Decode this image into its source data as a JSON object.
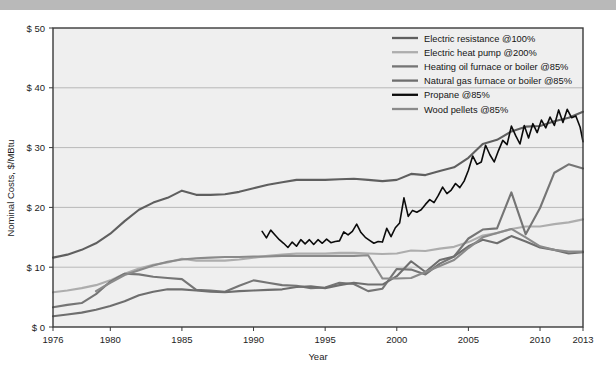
{
  "figure": {
    "background_color": "#efefef",
    "border_color": "#3a3a3a",
    "top_band_color": "#b9b9b9",
    "grid_color": "#a9a9a9"
  },
  "chart_data": {
    "type": "line",
    "title": "",
    "xlabel": "Year",
    "ylabel": "Nominal Costs, $/MBtu",
    "xlim": [
      1976,
      2013
    ],
    "ylim": [
      0,
      50
    ],
    "grid": true,
    "grid_axis": "y",
    "legend_position": "top-right",
    "x_ticks": [
      1976,
      1980,
      1985,
      1990,
      1995,
      2000,
      2005,
      2010,
      2013
    ],
    "x_tick_labels": [
      "1976",
      "1980",
      "1985",
      "1990",
      "1995",
      "2000",
      "2005",
      "2010",
      "2013"
    ],
    "y_ticks": [
      0,
      10,
      20,
      30,
      40,
      50
    ],
    "y_tick_labels": [
      "$ 0",
      "$ 10",
      "$ 20",
      "$ 30",
      "$ 40",
      "$ 50"
    ],
    "series": [
      {
        "name": "Electric resistance @100%",
        "color": "#5f5f5f",
        "width": 2.1,
        "x": [
          1976,
          1977,
          1978,
          1979,
          1980,
          1981,
          1982,
          1983,
          1984,
          1985,
          1986,
          1987,
          1988,
          1989,
          1990,
          1991,
          1992,
          1993,
          1994,
          1995,
          1996,
          1997,
          1998,
          1999,
          2000,
          2001,
          2002,
          2003,
          2004,
          2005,
          2006,
          2007,
          2008,
          2009,
          2010,
          2011,
          2012,
          2013
        ],
        "values": [
          11.6,
          12.1,
          12.9,
          14.0,
          15.6,
          17.7,
          19.6,
          20.8,
          21.6,
          22.8,
          22.1,
          22.1,
          22.2,
          22.6,
          23.2,
          23.8,
          24.2,
          24.6,
          24.6,
          24.6,
          24.7,
          24.8,
          24.6,
          24.4,
          24.6,
          25.6,
          25.4,
          26.1,
          26.7,
          28.3,
          30.6,
          31.3,
          32.7,
          33.5,
          33.6,
          34.4,
          35.0,
          36.0
        ]
      },
      {
        "name": "Electric heat pump @200%",
        "color": "#adadad",
        "width": 2.1,
        "x": [
          1976,
          1977,
          1978,
          1979,
          1980,
          1981,
          1982,
          1983,
          1984,
          1985,
          1986,
          1987,
          1988,
          1989,
          1990,
          1991,
          1992,
          1993,
          1994,
          1995,
          1996,
          1997,
          1998,
          1999,
          2000,
          2001,
          2002,
          2003,
          2004,
          2005,
          2006,
          2007,
          2008,
          2009,
          2010,
          2011,
          2012,
          2013
        ],
        "values": [
          5.8,
          6.1,
          6.5,
          7.0,
          7.8,
          8.9,
          9.8,
          10.4,
          10.8,
          11.4,
          11.1,
          11.1,
          11.1,
          11.3,
          11.6,
          11.9,
          12.1,
          12.3,
          12.3,
          12.3,
          12.4,
          12.4,
          12.3,
          12.2,
          12.3,
          12.8,
          12.7,
          13.1,
          13.4,
          14.2,
          15.3,
          15.7,
          16.4,
          16.8,
          16.8,
          17.2,
          17.5,
          18.0
        ]
      },
      {
        "name": "Heating oil furnace or boiler @85%",
        "color": "#757575",
        "width": 2.1,
        "x": [
          1976,
          1977,
          1978,
          1979,
          1980,
          1981,
          1982,
          1983,
          1984,
          1985,
          1986,
          1987,
          1988,
          1989,
          1990,
          1991,
          1992,
          1993,
          1994,
          1995,
          1996,
          1997,
          1998,
          1999,
          2000,
          2001,
          2002,
          2003,
          2004,
          2005,
          2006,
          2007,
          2008,
          2009,
          2010,
          2011,
          2012,
          2013
        ],
        "values": [
          3.3,
          3.7,
          4.0,
          5.5,
          7.6,
          8.9,
          8.8,
          8.4,
          8.2,
          8.0,
          6.2,
          6.1,
          5.9,
          6.9,
          7.8,
          7.4,
          7.0,
          6.9,
          6.5,
          6.6,
          7.4,
          7.2,
          6.0,
          6.4,
          9.7,
          9.6,
          8.8,
          10.6,
          11.8,
          14.8,
          16.3,
          16.5,
          22.5,
          15.5,
          19.9,
          25.8,
          27.2,
          26.5
        ]
      },
      {
        "name": "Natural gas furnace or boiler @85%",
        "color": "#6e6e6e",
        "width": 2.1,
        "x": [
          1976,
          1977,
          1978,
          1979,
          1980,
          1981,
          1982,
          1983,
          1984,
          1985,
          1986,
          1987,
          1988,
          1989,
          1990,
          1991,
          1992,
          1993,
          1994,
          1995,
          1996,
          1997,
          1998,
          1999,
          2000,
          2001,
          2002,
          2003,
          2004,
          2005,
          2006,
          2007,
          2008,
          2009,
          2010,
          2011,
          2012,
          2013
        ],
        "values": [
          1.8,
          2.1,
          2.4,
          2.9,
          3.5,
          4.3,
          5.3,
          5.9,
          6.3,
          6.3,
          6.1,
          5.9,
          5.8,
          6.0,
          6.1,
          6.2,
          6.3,
          6.7,
          6.8,
          6.5,
          7.0,
          7.4,
          7.1,
          7.1,
          8.5,
          11.0,
          9.2,
          11.2,
          11.8,
          13.5,
          14.6,
          14.0,
          15.2,
          14.3,
          13.3,
          12.9,
          12.3,
          12.5
        ]
      },
      {
        "name": "Propane @85%",
        "color": "#0b0b0b",
        "width": 1.6,
        "x": [
          1990.6,
          1990.9,
          1991.2,
          1991.5,
          1991.8,
          1992.1,
          1992.4,
          1992.7,
          1993.0,
          1993.3,
          1993.6,
          1993.9,
          1994.2,
          1994.5,
          1994.8,
          1995.1,
          1995.4,
          1995.7,
          1996.0,
          1996.3,
          1996.6,
          1996.9,
          1997.2,
          1997.5,
          1997.8,
          1998.1,
          1998.4,
          1998.7,
          1999.0,
          1999.3,
          1999.6,
          1999.9,
          2000.2,
          2000.5,
          2000.8,
          2001.1,
          2001.4,
          2001.7,
          2002.0,
          2002.3,
          2002.6,
          2002.9,
          2003.2,
          2003.5,
          2003.8,
          2004.1,
          2004.4,
          2004.7,
          2005.0,
          2005.3,
          2005.6,
          2005.9,
          2006.2,
          2006.5,
          2006.8,
          2007.1,
          2007.4,
          2007.7,
          2008.0,
          2008.3,
          2008.6,
          2008.9,
          2009.2,
          2009.5,
          2009.8,
          2010.1,
          2010.4,
          2010.7,
          2011.0,
          2011.3,
          2011.6,
          2011.9,
          2012.2,
          2012.5,
          2012.8,
          2013.0
        ],
        "values": [
          16.0,
          14.9,
          16.2,
          15.4,
          14.6,
          14.0,
          13.3,
          14.2,
          13.5,
          14.6,
          13.9,
          14.6,
          13.8,
          14.6,
          14.0,
          14.7,
          14.1,
          14.3,
          14.4,
          15.9,
          15.4,
          16.0,
          17.2,
          15.8,
          15.0,
          14.5,
          14.0,
          14.3,
          14.2,
          16.5,
          15.1,
          16.6,
          17.4,
          21.6,
          18.5,
          19.5,
          19.2,
          19.6,
          20.5,
          21.3,
          20.8,
          22.0,
          23.4,
          22.3,
          22.9,
          24.0,
          23.3,
          24.4,
          26.2,
          28.6,
          27.2,
          27.6,
          30.4,
          28.8,
          27.6,
          29.5,
          31.2,
          30.5,
          33.6,
          32.0,
          30.6,
          33.7,
          31.6,
          34.0,
          32.5,
          34.6,
          33.3,
          35.1,
          33.7,
          36.3,
          34.2,
          36.4,
          35.0,
          35.3,
          33.4,
          31.0
        ]
      },
      {
        "name": "Wood pellets @85%",
        "color": "#8a8a8a",
        "width": 2.1,
        "x": [
          1979,
          1980,
          1981,
          1982,
          1983,
          1984,
          1985,
          1986,
          1987,
          1988,
          1989,
          1990,
          1991,
          1992,
          1993,
          1994,
          1995,
          1996,
          1997,
          1998,
          1999,
          2000,
          2001,
          2002,
          2003,
          2004,
          2005,
          2006,
          2007,
          2008,
          2009,
          2010,
          2011,
          2012,
          2013
        ],
        "values": [
          6.0,
          7.4,
          8.7,
          9.5,
          10.3,
          10.9,
          11.3,
          11.5,
          11.6,
          11.7,
          11.7,
          11.8,
          11.8,
          11.9,
          11.9,
          11.9,
          11.9,
          11.9,
          11.9,
          12.0,
          8.1,
          8.1,
          8.2,
          9.2,
          10.2,
          11.2,
          13.2,
          15.0,
          15.7,
          16.4,
          15.0,
          13.5,
          12.9,
          12.6,
          12.6
        ]
      }
    ]
  },
  "legend": {
    "items": [
      {
        "label": "Electric resistance @100%",
        "color": "#5f5f5f",
        "width": 2.3
      },
      {
        "label": "Electric heat pump @200%",
        "color": "#adadad",
        "width": 2.3
      },
      {
        "label": "Heating oil furnace or boiler @85%",
        "color": "#757575",
        "width": 2.3
      },
      {
        "label": "Natural gas furnace or boiler @85%",
        "color": "#6e6e6e",
        "width": 2.3
      },
      {
        "label": "Propane @85%",
        "color": "#0b0b0b",
        "width": 2.3
      },
      {
        "label": "Wood pellets @85%",
        "color": "#8a8a8a",
        "width": 2.3
      }
    ]
  }
}
